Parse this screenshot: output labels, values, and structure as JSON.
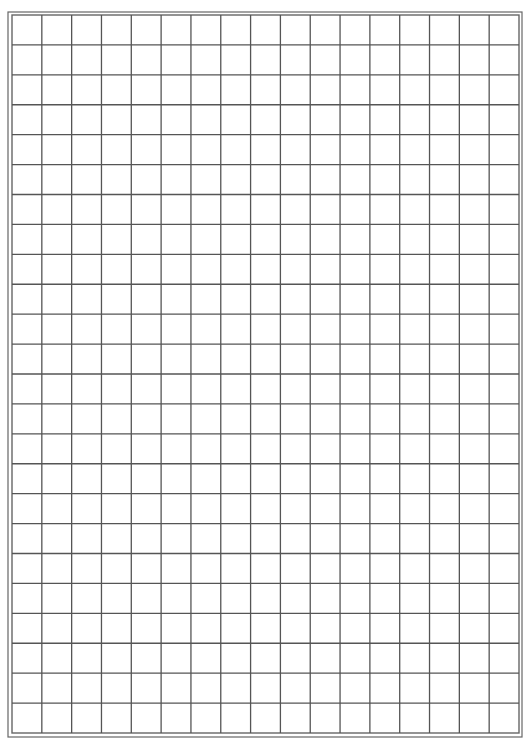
{
  "document": {
    "type": "grid-paper",
    "columns": 17,
    "rows": 24,
    "cell_size_px": 29.85,
    "colors": {
      "background": "#ffffff",
      "grid_line": "#555555",
      "border_line": "#666666"
    },
    "border": {
      "style": "double",
      "outer": {
        "left": 8,
        "top": 12,
        "right": 522,
        "bottom": 737
      },
      "inner": {
        "left": 12,
        "top": 15,
        "right": 519,
        "bottom": 733
      }
    }
  }
}
